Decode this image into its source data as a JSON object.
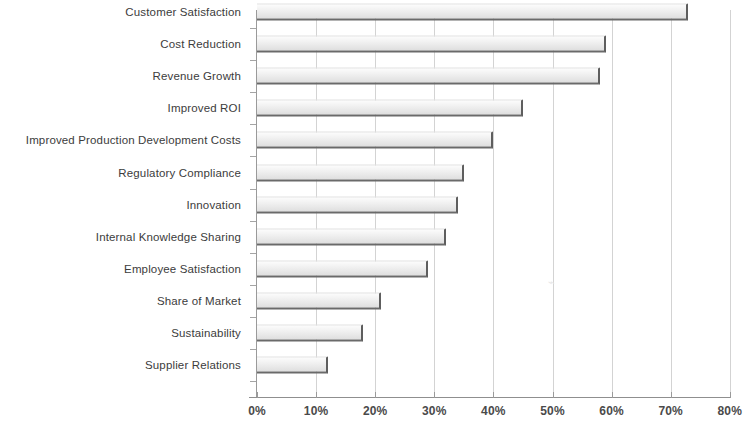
{
  "chart_data": {
    "type": "bar",
    "orientation": "horizontal",
    "title": "",
    "xlabel": "",
    "ylabel": "",
    "xlim": [
      0,
      80
    ],
    "xtick_labels": [
      "0%",
      "10%",
      "20%",
      "30%",
      "40%",
      "50%",
      "60%",
      "70%",
      "80%"
    ],
    "xtick_values": [
      0,
      10,
      20,
      30,
      40,
      50,
      60,
      70,
      80
    ],
    "grid": "vertical",
    "legend": "none",
    "units": "percent",
    "bar_color": "#ededed",
    "bar_edge_color": "#5e5e5e",
    "grid_color": "#d3d3d3",
    "axis_color": "#8f8f8f",
    "text_color": "#3c3c3c",
    "categories": [
      "Customer Satisfaction",
      "Cost Reduction",
      "Revenue Growth",
      "Improved ROI",
      "Improved Production Development Costs",
      "Regulatory Compliance",
      "Innovation",
      "Internal Knowledge Sharing",
      "Employee Satisfaction",
      "Share of Market",
      "Sustainability",
      "Supplier Relations"
    ],
    "values": [
      73,
      59,
      58,
      45,
      40,
      35,
      34,
      32,
      29,
      21,
      18,
      12
    ]
  }
}
